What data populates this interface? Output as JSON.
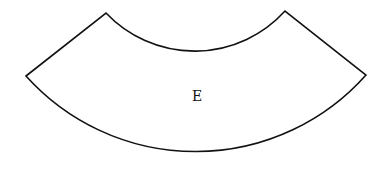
{
  "diagram": {
    "shape": "annular-sector",
    "label": "E",
    "stroke_color": "#111111",
    "fill_color": "#ffffff",
    "vertices": {
      "outer_left": [
        26,
        76
      ],
      "inner_left": [
        106,
        13
      ],
      "inner_right": [
        285,
        11
      ],
      "outer_right": [
        366,
        75
      ]
    },
    "inner_arc_lowest_y": 60,
    "outer_arc_lowest_y": 165,
    "label_position": [
      197,
      96
    ]
  }
}
